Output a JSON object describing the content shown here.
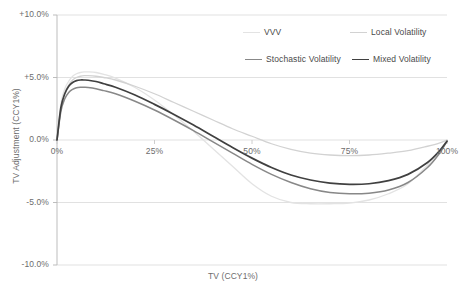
{
  "chart_data": {
    "type": "line",
    "title": "",
    "xlabel": "TV (CCY1%)",
    "ylabel": "TV Adjustment (CCY1%)",
    "xlim": [
      0,
      100
    ],
    "ylim": [
      -10,
      10
    ],
    "grid": true,
    "legend_position": "top-right",
    "x_ticks": [
      "0%",
      "25%",
      "50%",
      "75%",
      "100%"
    ],
    "x_tick_values": [
      0,
      25,
      50,
      75,
      100
    ],
    "y_ticks": [
      "+10.0%",
      "+5.0%",
      "0.0%",
      "-5.0%",
      "-10.0%"
    ],
    "y_tick_values": [
      10,
      5,
      0,
      -5,
      -10
    ],
    "x": [
      0,
      1,
      2,
      3,
      4,
      5,
      6,
      7,
      8,
      10,
      12,
      15,
      20,
      25,
      30,
      35,
      40,
      45,
      50,
      55,
      60,
      65,
      70,
      75,
      80,
      85,
      90,
      95,
      98,
      100
    ],
    "series": [
      {
        "name": "VVV",
        "color": "#e3e3e3",
        "width": 1.3,
        "values": [
          0.0,
          2.9,
          4.1,
          4.7,
          5.1,
          5.3,
          5.4,
          5.45,
          5.45,
          5.4,
          5.25,
          4.95,
          4.2,
          3.2,
          2.0,
          0.7,
          -0.7,
          -2.1,
          -3.5,
          -4.5,
          -5.0,
          -5.1,
          -5.1,
          -5.05,
          -4.8,
          -4.3,
          -3.5,
          -2.0,
          -0.9,
          0.0
        ]
      },
      {
        "name": "Local Volatility",
        "color": "#d2d2d2",
        "width": 1.3,
        "values": [
          0.0,
          2.6,
          3.8,
          4.4,
          4.8,
          5.0,
          5.1,
          5.15,
          5.15,
          5.1,
          5.0,
          4.8,
          4.3,
          3.7,
          3.0,
          2.3,
          1.6,
          0.9,
          0.3,
          -0.3,
          -0.75,
          -1.05,
          -1.2,
          -1.25,
          -1.2,
          -1.05,
          -0.85,
          -0.5,
          -0.25,
          0.0
        ]
      },
      {
        "name": "Stochastic Volatility",
        "color": "#888888",
        "width": 1.5,
        "values": [
          0.0,
          2.3,
          3.3,
          3.8,
          4.05,
          4.18,
          4.22,
          4.22,
          4.2,
          4.1,
          3.95,
          3.7,
          3.1,
          2.4,
          1.6,
          0.75,
          -0.15,
          -1.05,
          -1.95,
          -2.75,
          -3.4,
          -3.9,
          -4.2,
          -4.3,
          -4.25,
          -4.0,
          -3.4,
          -2.2,
          -1.1,
          -0.1
        ]
      },
      {
        "name": "Mixed Volatility",
        "color": "#404040",
        "width": 1.7,
        "values": [
          0.0,
          2.6,
          3.7,
          4.3,
          4.6,
          4.75,
          4.8,
          4.8,
          4.78,
          4.68,
          4.5,
          4.22,
          3.6,
          2.85,
          2.05,
          1.2,
          0.3,
          -0.6,
          -1.45,
          -2.2,
          -2.8,
          -3.2,
          -3.45,
          -3.55,
          -3.5,
          -3.25,
          -2.75,
          -1.8,
          -0.9,
          -0.1
        ]
      }
    ]
  },
  "legend": {
    "items": [
      {
        "label": "VVV"
      },
      {
        "label": "Local Volatility"
      },
      {
        "label": "Stochastic Volatility"
      },
      {
        "label": "Mixed Volatility"
      }
    ]
  }
}
